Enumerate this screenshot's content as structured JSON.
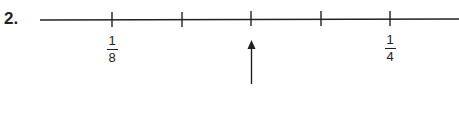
{
  "problem": {
    "number": "2."
  },
  "number_line": {
    "ticks": [
      {
        "x": 112,
        "label_num": "1",
        "label_den": "8"
      },
      {
        "x": 182
      },
      {
        "x": 251
      },
      {
        "x": 321
      },
      {
        "x": 390,
        "label_num": "1",
        "label_den": "4"
      }
    ],
    "arrow_points_to_tick": 3
  },
  "labels": {
    "left": {
      "numerator": "1",
      "denominator": "8"
    },
    "right": {
      "numerator": "1",
      "denominator": "4"
    }
  }
}
